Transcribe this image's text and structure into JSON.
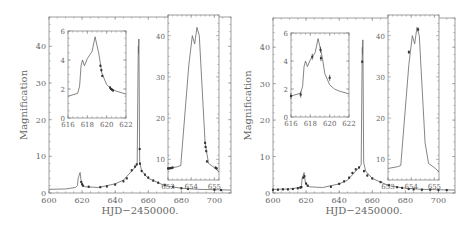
{
  "chart_data": [
    {
      "type": "line",
      "panel": "left",
      "title": "",
      "xlabel": "HJD−2450000.",
      "ylabel": "Magnification",
      "xlim": [
        600,
        710
      ],
      "ylim": [
        0,
        48
      ],
      "xticks": [
        600,
        620,
        640,
        660,
        680,
        700
      ],
      "yticks": [
        0,
        10,
        20,
        30,
        40
      ],
      "model_curve": {
        "x": [
          600,
          610,
          616,
          617.2,
          617.6,
          618,
          618.8,
          619.5,
          620.5,
          622,
          630,
          640,
          645,
          650,
          652,
          653,
          653.3,
          653.8,
          654.0,
          654.1,
          654.3,
          654.5,
          654.8,
          655,
          656,
          660,
          670,
          680,
          690,
          700,
          710
        ],
        "y": [
          1.0,
          1.1,
          1.5,
          2.0,
          4.0,
          4.5,
          5.6,
          3.0,
          2.0,
          1.7,
          1.5,
          2.5,
          3.5,
          6.0,
          7.0,
          7.6,
          7.8,
          33,
          40,
          38,
          42,
          30,
          8.5,
          8.0,
          6.0,
          4.0,
          2.0,
          1.3,
          1.0,
          0.9,
          0.8
        ]
      },
      "data_points": {
        "x": [
          619.5,
          620,
          620.5,
          624,
          631,
          635,
          640,
          645,
          647,
          650,
          652,
          653,
          654.8,
          655,
          656,
          658,
          660,
          663,
          666,
          670,
          675,
          680,
          684,
          700,
          704
        ],
        "y": [
          3.0,
          2.4,
          2.0,
          1.7,
          1.6,
          1.8,
          2.3,
          3.2,
          4.0,
          6.2,
          7.2,
          7.8,
          12.0,
          8.0,
          6.0,
          5.0,
          4.2,
          3.4,
          2.8,
          2.2,
          1.7,
          1.3,
          1.1,
          0.9,
          0.8
        ]
      },
      "insets": [
        {
          "xlim": [
            616,
            622
          ],
          "ylim": [
            0,
            6
          ],
          "xticks": [
            616,
            618,
            620,
            622
          ],
          "yticks": [
            0,
            2,
            4,
            6
          ],
          "model_curve": {
            "x": [
              616,
              617.0,
              617.2,
              617.35,
              617.5,
              617.7,
              618.0,
              618.5,
              618.8,
              619.2,
              619.5,
              620.0,
              620.5,
              621.0,
              622.0
            ],
            "y": [
              1.5,
              1.7,
              2.2,
              3.6,
              4.0,
              3.6,
              4.1,
              4.6,
              5.6,
              4.4,
              3.1,
              2.3,
              2.0,
              1.85,
              1.65
            ]
          },
          "data_points": {
            "x": [
              619.35,
              619.45,
              619.55,
              620.35,
              620.45,
              620.55,
              620.65
            ],
            "y": [
              3.6,
              3.3,
              2.9,
              2.1,
              2.0,
              1.95,
              1.9
            ]
          }
        },
        {
          "xlim": [
            653,
            655.2
          ],
          "ylim": [
            5,
            45
          ],
          "xticks": [
            653,
            654,
            655
          ],
          "yticks": [
            10,
            20,
            30,
            40
          ],
          "model_curve": {
            "x": [
              653,
              653.4,
              653.55,
              653.9,
              654.05,
              654.15,
              654.25,
              654.35,
              654.6,
              654.75,
              655.0,
              655.2
            ],
            "y": [
              7.8,
              8.2,
              8.5,
              33,
              40,
              38,
              42,
              40,
              14,
              9.0,
              8.0,
              7.0
            ],
            "note": "two-peaked caustic crossing"
          },
          "data_points": {
            "x": [
              653.0,
              653.05,
              653.1,
              653.15,
              653.2,
              654.6,
              654.62,
              654.65,
              654.68,
              655.05,
              655.1
            ],
            "y": [
              7.8,
              7.8,
              7.9,
              7.9,
              8.0,
              14.0,
              13.0,
              12.0,
              9.5,
              8.0,
              7.8
            ]
          }
        }
      ]
    },
    {
      "type": "line",
      "panel": "right",
      "title": "",
      "xlabel": "HJD−2450000.",
      "ylabel": "Magnification",
      "xlim": [
        600,
        710
      ],
      "ylim": [
        0,
        48
      ],
      "xticks": [
        600,
        620,
        640,
        660,
        680,
        700
      ],
      "yticks": [
        0,
        10,
        20,
        30,
        40
      ],
      "model_curve": {
        "x": [
          600,
          610,
          616,
          617.2,
          617.6,
          618,
          618.8,
          619.5,
          620.5,
          622,
          630,
          640,
          645,
          650,
          652,
          653,
          653.3,
          653.8,
          654.0,
          654.1,
          654.3,
          654.5,
          654.8,
          655,
          656,
          660,
          670,
          680,
          690,
          700,
          710
        ],
        "y": [
          1.0,
          1.1,
          1.5,
          2.0,
          4.0,
          4.5,
          5.6,
          3.0,
          2.0,
          1.7,
          1.5,
          2.5,
          3.5,
          6.0,
          7.0,
          7.6,
          7.8,
          33,
          40,
          38,
          42,
          30,
          8.5,
          8.0,
          6.0,
          4.0,
          2.0,
          1.3,
          1.0,
          0.9,
          0.8
        ]
      },
      "data_points": {
        "x": [
          600,
          603,
          606,
          609,
          612,
          615,
          616.5,
          617.2,
          618.3,
          619,
          620,
          621,
          635,
          640,
          643,
          646,
          648,
          650,
          652,
          653.9,
          655,
          657,
          660,
          665,
          670,
          675,
          678,
          682,
          685,
          690,
          695,
          700,
          705
        ],
        "y": [
          0.9,
          0.9,
          1.0,
          1.0,
          1.1,
          1.3,
          1.5,
          1.6,
          4.2,
          4.6,
          2.6,
          2.0,
          1.7,
          2.5,
          3.2,
          4.2,
          5.5,
          6.5,
          7.0,
          36.0,
          6.0,
          4.8,
          4.0,
          3.0,
          2.2,
          1.6,
          1.4,
          1.1,
          1.0,
          0.9,
          0.9,
          0.8,
          0.8
        ]
      },
      "insets": [
        {
          "xlim": [
            616,
            622
          ],
          "ylim": [
            0,
            6
          ],
          "xticks": [
            616,
            618,
            620,
            622
          ],
          "yticks": [
            0,
            2,
            4,
            6
          ],
          "model_curve": {
            "x": [
              616,
              617.0,
              617.2,
              617.35,
              617.5,
              617.7,
              618.0,
              618.5,
              618.8,
              619.2,
              619.5,
              620.0,
              620.5,
              621.0,
              622.0
            ],
            "y": [
              1.5,
              1.7,
              2.2,
              3.6,
              4.0,
              3.6,
              4.1,
              4.6,
              5.6,
              4.4,
              3.1,
              2.3,
              2.0,
              1.85,
              1.65
            ]
          },
          "data_points": {
            "x": [
              616.0,
              617.0,
              618.2,
              619.05,
              619.1,
              620.0
            ],
            "y": [
              1.5,
              1.6,
              4.3,
              4.8,
              4.2,
              2.8
            ]
          }
        },
        {
          "xlim": [
            653,
            655.2
          ],
          "ylim": [
            5,
            45
          ],
          "xticks": [
            653,
            654,
            655
          ],
          "yticks": [
            10,
            20,
            30,
            40
          ],
          "model_curve": {
            "x": [
              653,
              653.4,
              653.55,
              653.9,
              654.05,
              654.15,
              654.25,
              654.35,
              654.6,
              654.75,
              655.0,
              655.2
            ],
            "y": [
              7.8,
              8.2,
              8.5,
              33,
              40,
              38,
              42,
              40,
              14,
              9.0,
              8.0,
              7.0
            ]
          },
          "data_points": {
            "x": [
              653.9,
              654.3
            ],
            "y": [
              36.0,
              41.5
            ]
          }
        }
      ]
    }
  ],
  "labels": {
    "ylabel": "Magnification",
    "xlabel": "HJD−2450000.",
    "main_xticks": [
      "600",
      "620",
      "640",
      "660",
      "680",
      "700"
    ],
    "main_yticks": [
      "0",
      "10",
      "20",
      "30",
      "40"
    ],
    "inset1_xticks": [
      "616",
      "618",
      "620",
      "622"
    ],
    "inset1_yticks": [
      "0",
      "2",
      "4",
      "6"
    ],
    "inset2_xticks": [
      "653",
      "654",
      "655"
    ],
    "inset2_yticks": [
      "10",
      "20",
      "30",
      "40"
    ]
  }
}
